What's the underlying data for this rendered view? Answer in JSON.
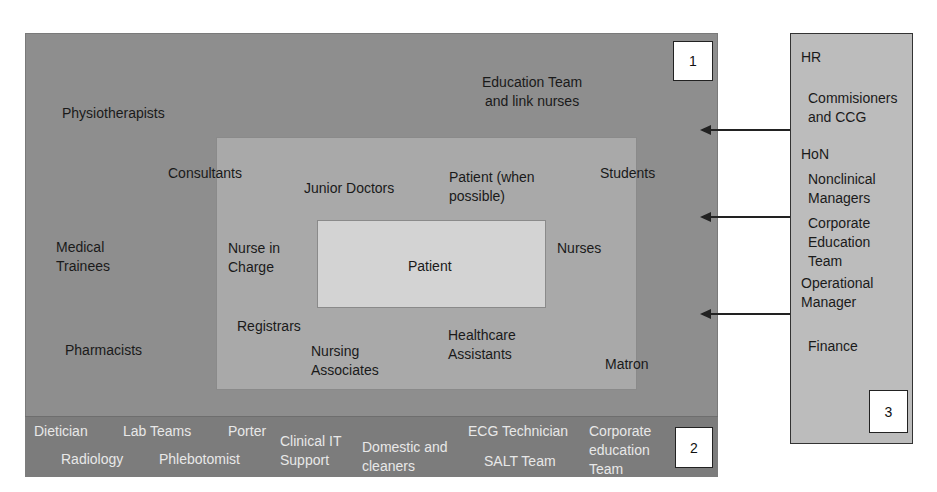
{
  "diagram": {
    "zone1": {
      "badge": "1",
      "labels": {
        "physiotherapists": "Physiotherapists",
        "education_team": "Education Team\nand link nurses",
        "medical_trainees": "Medical\nTrainees",
        "pharmacists": "Pharmacists"
      }
    },
    "middle": {
      "labels": {
        "consultants": "Consultants",
        "junior_doctors": "Junior Doctors",
        "patient_when_possible": "Patient (when\npossible)",
        "students": "Students",
        "nurse_in_charge": "Nurse in\nCharge",
        "nurses": "Nurses",
        "registrars": "Registrars",
        "nursing_associates": "Nursing\nAssociates",
        "healthcare_assistants": "Healthcare\nAssistants",
        "matron": "Matron"
      }
    },
    "core": {
      "label": "Patient"
    },
    "zone2": {
      "badge": "2",
      "labels": {
        "dietician": "Dietician",
        "lab_teams": "Lab Teams",
        "porter": "Porter",
        "radiology": "Radiology",
        "phlebotomist": "Phlebotomist",
        "clinical_it": "Clinical IT\nSupport",
        "domestic": "Domestic and\ncleaners",
        "ecg": "ECG Technician",
        "salt": "SALT Team",
        "corporate_education": "Corporate\neducation\nTeam"
      }
    },
    "zone3": {
      "badge": "3",
      "labels": {
        "hr": "HR",
        "commissioners": "Commisioners\nand CCG",
        "hon": "HoN",
        "nonclinical": "Nonclinical\nManagers",
        "corporate_education": "Corporate\nEducation\nTeam",
        "operational": "Operational\nManager",
        "finance": "Finance"
      }
    },
    "arrows": [
      {
        "from": "zone3",
        "to": "zone1",
        "y": 129
      },
      {
        "from": "zone3",
        "to": "zone1",
        "y": 216
      },
      {
        "from": "zone3",
        "to": "zone1",
        "y": 313
      }
    ],
    "colors": {
      "zone1": "#8e8e8e",
      "zone2": "#7c7c7c",
      "middle": "#a9a9a9",
      "core": "#d3d3d3",
      "zone3": "#bcbcbc"
    }
  }
}
